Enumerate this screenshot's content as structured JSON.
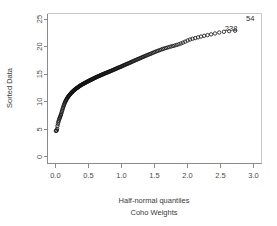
{
  "figure": {
    "background": "#ffffff",
    "axis_color": "#8a8a8a",
    "point_color": "#111111",
    "text_color": "#3a3a3a"
  },
  "labels": {
    "xlabel": "Half-normal quantiles",
    "sublabel": "Coho Weights",
    "ylabel": "Sorted Data",
    "outlier_top_right": "54",
    "outlier_inline": "238"
  },
  "chart_data": {
    "type": "scatter",
    "title": "",
    "subtitle": "Coho Weights",
    "xlabel": "Half-normal quantiles",
    "ylabel": "Sorted Data",
    "xlim": [
      -0.12,
      3.12
    ],
    "ylim": [
      -1.2,
      26.0
    ],
    "xticks": [
      0.0,
      0.5,
      1.0,
      1.5,
      2.0,
      2.5,
      3.0
    ],
    "xticklabels": [
      "0.0",
      "0.5",
      "1.0",
      "1.5",
      "2.0",
      "2.5",
      "3.0"
    ],
    "yticks": [
      0,
      5,
      10,
      15,
      20,
      25
    ],
    "yticklabels": [
      "0",
      "5",
      "10",
      "15",
      "20",
      "25"
    ],
    "grid": false,
    "legend": null,
    "marker": "open-circle",
    "annotations": [
      {
        "text": "54",
        "x": 2.95,
        "y": 24.6
      },
      {
        "text": "238",
        "x": 2.66,
        "y": 22.9
      }
    ],
    "series": [
      {
        "name": "Coho Weights half-normal quantiles",
        "x": [
          0.006,
          0.013,
          0.019,
          0.025,
          0.031,
          0.038,
          0.044,
          0.05,
          0.057,
          0.063,
          0.069,
          0.075,
          0.082,
          0.088,
          0.094,
          0.101,
          0.107,
          0.113,
          0.12,
          0.126,
          0.132,
          0.139,
          0.145,
          0.151,
          0.158,
          0.164,
          0.17,
          0.177,
          0.183,
          0.19,
          0.196,
          0.203,
          0.209,
          0.216,
          0.222,
          0.229,
          0.235,
          0.242,
          0.249,
          0.255,
          0.262,
          0.269,
          0.275,
          0.282,
          0.289,
          0.296,
          0.303,
          0.31,
          0.317,
          0.324,
          0.331,
          0.338,
          0.345,
          0.352,
          0.359,
          0.366,
          0.374,
          0.381,
          0.388,
          0.396,
          0.403,
          0.411,
          0.418,
          0.426,
          0.433,
          0.441,
          0.449,
          0.457,
          0.464,
          0.472,
          0.48,
          0.488,
          0.496,
          0.504,
          0.512,
          0.52,
          0.529,
          0.537,
          0.545,
          0.554,
          0.562,
          0.571,
          0.579,
          0.588,
          0.597,
          0.605,
          0.614,
          0.623,
          0.632,
          0.641,
          0.65,
          0.66,
          0.669,
          0.678,
          0.688,
          0.697,
          0.707,
          0.716,
          0.726,
          0.736,
          0.746,
          0.756,
          0.766,
          0.776,
          0.786,
          0.797,
          0.807,
          0.818,
          0.828,
          0.839,
          0.85,
          0.861,
          0.872,
          0.883,
          0.895,
          0.906,
          0.918,
          0.929,
          0.941,
          0.953,
          0.965,
          0.978,
          0.99,
          1.003,
          1.015,
          1.028,
          1.041,
          1.054,
          1.068,
          1.081,
          1.095,
          1.109,
          1.123,
          1.137,
          1.151,
          1.166,
          1.181,
          1.196,
          1.211,
          1.227,
          1.242,
          1.258,
          1.275,
          1.291,
          1.308,
          1.325,
          1.342,
          1.36,
          1.378,
          1.396,
          1.415,
          1.434,
          1.453,
          1.473,
          1.493,
          1.514,
          1.535,
          1.557,
          1.579,
          1.602,
          1.625,
          1.649,
          1.673,
          1.699,
          1.725,
          1.751,
          1.779,
          1.807,
          1.837,
          1.867,
          1.899,
          1.931,
          1.965,
          2.001,
          2.038,
          2.076,
          2.117,
          2.159,
          2.204,
          2.252,
          2.303,
          2.357,
          2.416,
          2.48,
          2.551,
          2.63,
          2.72
        ],
        "y": [
          4.7,
          4.75,
          4.8,
          5.1,
          5.6,
          6.0,
          6.3,
          6.55,
          6.8,
          7.0,
          7.2,
          7.4,
          7.6,
          7.85,
          8.1,
          8.35,
          8.6,
          8.85,
          9.1,
          9.3,
          9.5,
          9.7,
          9.9,
          10.05,
          10.2,
          10.35,
          10.5,
          10.62,
          10.74,
          10.86,
          10.96,
          11.06,
          11.16,
          11.26,
          11.35,
          11.44,
          11.53,
          11.62,
          11.7,
          11.78,
          11.86,
          11.94,
          12.01,
          12.08,
          12.15,
          12.22,
          12.29,
          12.36,
          12.42,
          12.48,
          12.54,
          12.6,
          12.66,
          12.72,
          12.78,
          12.84,
          12.9,
          12.96,
          13.02,
          13.07,
          13.12,
          13.17,
          13.22,
          13.27,
          13.32,
          13.37,
          13.42,
          13.47,
          13.52,
          13.57,
          13.62,
          13.67,
          13.72,
          13.77,
          13.82,
          13.87,
          13.92,
          13.97,
          14.02,
          14.07,
          14.12,
          14.17,
          14.22,
          14.27,
          14.32,
          14.37,
          14.42,
          14.47,
          14.52,
          14.57,
          14.62,
          14.67,
          14.72,
          14.77,
          14.82,
          14.87,
          14.92,
          14.97,
          15.02,
          15.07,
          15.12,
          15.17,
          15.22,
          15.27,
          15.32,
          15.37,
          15.42,
          15.47,
          15.52,
          15.57,
          15.63,
          15.69,
          15.75,
          15.81,
          15.87,
          15.93,
          15.99,
          16.05,
          16.11,
          16.17,
          16.23,
          16.29,
          16.35,
          16.42,
          16.49,
          16.56,
          16.63,
          16.7,
          16.77,
          16.84,
          16.91,
          16.98,
          17.05,
          17.13,
          17.21,
          17.29,
          17.37,
          17.45,
          17.53,
          17.61,
          17.69,
          17.77,
          17.85,
          17.94,
          18.03,
          18.12,
          18.21,
          18.3,
          18.39,
          18.48,
          18.57,
          18.66,
          18.76,
          18.86,
          18.96,
          19.06,
          19.16,
          19.26,
          19.36,
          19.46,
          19.56,
          19.66,
          19.75,
          19.84,
          19.93,
          20.02,
          20.11,
          20.2,
          20.3,
          20.42,
          20.56,
          20.72,
          20.9,
          21.1,
          21.28,
          21.42,
          21.54,
          21.68,
          21.82,
          21.95,
          22.08,
          22.22,
          22.38,
          22.55,
          22.68,
          22.8,
          22.88
        ]
      }
    ]
  }
}
